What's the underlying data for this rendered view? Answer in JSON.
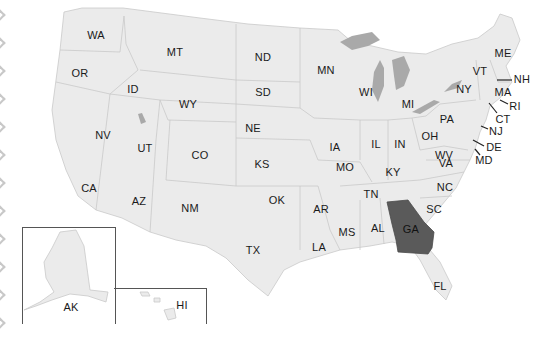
{
  "map": {
    "title": "United States map",
    "highlight_color": "#5a5a5a",
    "base_color": "#ebebeb",
    "lake_color": "#a9a9a9",
    "highlighted_state": "GA",
    "states": [
      {
        "abbr": "WA",
        "x": 96,
        "y": 35
      },
      {
        "abbr": "MT",
        "x": 175,
        "y": 52
      },
      {
        "abbr": "ND",
        "x": 263,
        "y": 57
      },
      {
        "abbr": "MN",
        "x": 326,
        "y": 70
      },
      {
        "abbr": "OR",
        "x": 80,
        "y": 73
      },
      {
        "abbr": "ID",
        "x": 133,
        "y": 89
      },
      {
        "abbr": "SD",
        "x": 263,
        "y": 92
      },
      {
        "abbr": "WY",
        "x": 188,
        "y": 104
      },
      {
        "abbr": "WI",
        "x": 366,
        "y": 92
      },
      {
        "abbr": "MI",
        "x": 408,
        "y": 104
      },
      {
        "abbr": "NY",
        "x": 464,
        "y": 89
      },
      {
        "abbr": "VT",
        "x": 480,
        "y": 71
      },
      {
        "abbr": "ME",
        "x": 503,
        "y": 53
      },
      {
        "abbr": "NH",
        "x": 522,
        "y": 79
      },
      {
        "abbr": "MA",
        "x": 503,
        "y": 92
      },
      {
        "abbr": "RI",
        "x": 515,
        "y": 106
      },
      {
        "abbr": "CT",
        "x": 503,
        "y": 119
      },
      {
        "abbr": "NJ",
        "x": 496,
        "y": 131
      },
      {
        "abbr": "DE",
        "x": 494,
        "y": 147
      },
      {
        "abbr": "MD",
        "x": 484,
        "y": 160
      },
      {
        "abbr": "PA",
        "x": 447,
        "y": 119
      },
      {
        "abbr": "NE",
        "x": 253,
        "y": 128
      },
      {
        "abbr": "IA",
        "x": 335,
        "y": 147
      },
      {
        "abbr": "IL",
        "x": 376,
        "y": 144
      },
      {
        "abbr": "IN",
        "x": 400,
        "y": 144
      },
      {
        "abbr": "OH",
        "x": 430,
        "y": 136
      },
      {
        "abbr": "NV",
        "x": 103,
        "y": 135
      },
      {
        "abbr": "UT",
        "x": 145,
        "y": 148
      },
      {
        "abbr": "CO",
        "x": 200,
        "y": 155
      },
      {
        "abbr": "WV",
        "x": 444,
        "y": 155
      },
      {
        "abbr": "VA",
        "x": 446,
        "y": 163
      },
      {
        "abbr": "KY",
        "x": 393,
        "y": 172
      },
      {
        "abbr": "KS",
        "x": 262,
        "y": 164
      },
      {
        "abbr": "MO",
        "x": 345,
        "y": 167
      },
      {
        "abbr": "CA",
        "x": 89,
        "y": 188
      },
      {
        "abbr": "NC",
        "x": 445,
        "y": 187
      },
      {
        "abbr": "TN",
        "x": 371,
        "y": 194
      },
      {
        "abbr": "AZ",
        "x": 139,
        "y": 201
      },
      {
        "abbr": "NM",
        "x": 190,
        "y": 208
      },
      {
        "abbr": "OK",
        "x": 277,
        "y": 200
      },
      {
        "abbr": "AR",
        "x": 321,
        "y": 209
      },
      {
        "abbr": "SC",
        "x": 434,
        "y": 209
      },
      {
        "abbr": "GA",
        "x": 411,
        "y": 229
      },
      {
        "abbr": "AL",
        "x": 378,
        "y": 228
      },
      {
        "abbr": "MS",
        "x": 347,
        "y": 232
      },
      {
        "abbr": "LA",
        "x": 319,
        "y": 247
      },
      {
        "abbr": "TX",
        "x": 253,
        "y": 250
      },
      {
        "abbr": "FL",
        "x": 440,
        "y": 286
      },
      {
        "abbr": "AK",
        "x": 71,
        "y": 307
      },
      {
        "abbr": "HI",
        "x": 182,
        "y": 305
      }
    ]
  }
}
